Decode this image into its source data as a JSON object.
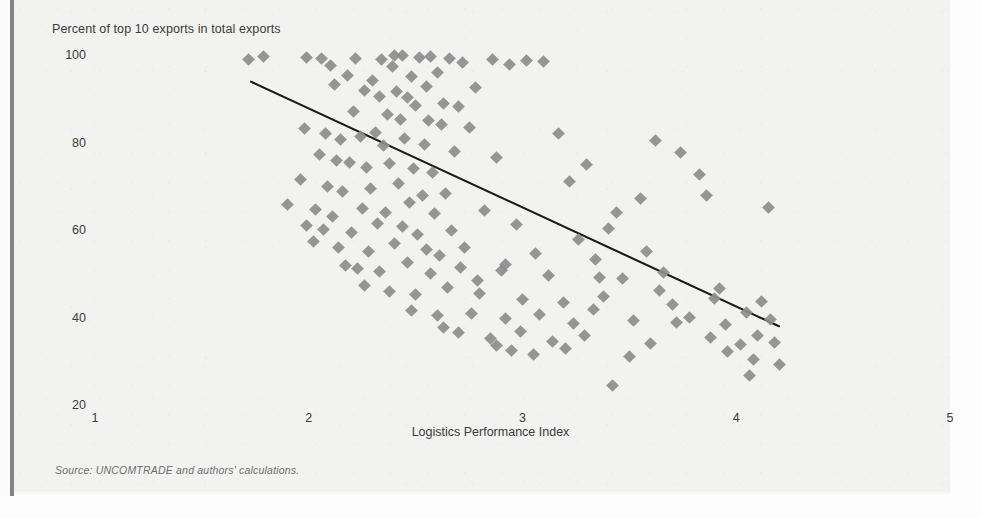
{
  "figure": {
    "source_note_label": "Source:",
    "source_note_text": " UNCOMTRADE and authors' calculations."
  },
  "chart_data": {
    "type": "scatter",
    "title": "",
    "ylabel": "Percent of top 10 exports in total exports",
    "xlabel": "Logistics Performance Index",
    "xlim": [
      1,
      5
    ],
    "ylim": [
      20,
      100
    ],
    "xticks": [
      1,
      2,
      3,
      4,
      5
    ],
    "yticks": [
      20,
      40,
      60,
      80,
      100
    ],
    "xtick_labels": [
      "1",
      "2",
      "3",
      "4",
      "5"
    ],
    "ytick_labels": [
      "20",
      "40",
      "60",
      "80",
      "100"
    ],
    "grid": false,
    "legend": null,
    "marker": "diamond",
    "marker_color": "#8d8d8d",
    "trendline": {
      "type": "linear",
      "color": "#1a1a1a",
      "x_start": 1.73,
      "y_start": 93.9,
      "x_end": 4.2,
      "y_end": 38.0
    },
    "points": [
      [
        1.72,
        99.0
      ],
      [
        1.79,
        99.6
      ],
      [
        1.99,
        99.5
      ],
      [
        2.06,
        99.1
      ],
      [
        2.1,
        97.6
      ],
      [
        2.18,
        95.4
      ],
      [
        2.22,
        99.3
      ],
      [
        2.3,
        94.2
      ],
      [
        2.34,
        99.0
      ],
      [
        2.39,
        97.3
      ],
      [
        2.4,
        99.9
      ],
      [
        2.44,
        99.8
      ],
      [
        2.48,
        95.0
      ],
      [
        2.52,
        99.4
      ],
      [
        2.57,
        99.7
      ],
      [
        2.6,
        96.1
      ],
      [
        2.66,
        99.2
      ],
      [
        2.72,
        98.4
      ],
      [
        2.78,
        92.6
      ],
      [
        2.86,
        99.0
      ],
      [
        2.94,
        97.9
      ],
      [
        3.02,
        98.7
      ],
      [
        3.1,
        98.6
      ],
      [
        2.12,
        93.3
      ],
      [
        2.26,
        92.0
      ],
      [
        2.33,
        90.5
      ],
      [
        2.41,
        91.7
      ],
      [
        2.46,
        90.3
      ],
      [
        2.5,
        88.5
      ],
      [
        2.55,
        92.8
      ],
      [
        2.63,
        89.0
      ],
      [
        2.7,
        88.2
      ],
      [
        2.21,
        87.0
      ],
      [
        2.37,
        86.4
      ],
      [
        2.43,
        85.3
      ],
      [
        2.56,
        85.0
      ],
      [
        2.62,
        84.2
      ],
      [
        2.75,
        83.5
      ],
      [
        1.98,
        83.3
      ],
      [
        2.08,
        82.0
      ],
      [
        2.15,
        80.6
      ],
      [
        2.24,
        81.3
      ],
      [
        2.31,
        82.2
      ],
      [
        2.35,
        79.4
      ],
      [
        2.45,
        80.9
      ],
      [
        2.54,
        79.6
      ],
      [
        2.68,
        78.0
      ],
      [
        3.17,
        82.1
      ],
      [
        3.62,
        80.4
      ],
      [
        3.74,
        77.8
      ],
      [
        2.05,
        77.2
      ],
      [
        2.13,
        76.0
      ],
      [
        2.19,
        75.4
      ],
      [
        2.27,
        74.3
      ],
      [
        2.38,
        75.1
      ],
      [
        2.49,
        74.0
      ],
      [
        2.58,
        73.2
      ],
      [
        2.88,
        76.5
      ],
      [
        3.3,
        74.9
      ],
      [
        3.83,
        72.6
      ],
      [
        1.96,
        71.5
      ],
      [
        2.09,
        70.0
      ],
      [
        2.16,
        68.8
      ],
      [
        2.29,
        69.5
      ],
      [
        2.42,
        70.6
      ],
      [
        2.53,
        67.9
      ],
      [
        2.64,
        68.4
      ],
      [
        3.22,
        71.0
      ],
      [
        3.55,
        67.1
      ],
      [
        3.86,
        68.0
      ],
      [
        1.9,
        65.8
      ],
      [
        2.03,
        64.7
      ],
      [
        2.11,
        63.2
      ],
      [
        2.25,
        65.0
      ],
      [
        2.36,
        64.1
      ],
      [
        2.47,
        66.2
      ],
      [
        2.59,
        63.8
      ],
      [
        2.82,
        64.4
      ],
      [
        3.44,
        63.9
      ],
      [
        4.15,
        65.1
      ],
      [
        1.99,
        61.0
      ],
      [
        2.07,
        60.2
      ],
      [
        2.2,
        59.5
      ],
      [
        2.32,
        61.6
      ],
      [
        2.44,
        60.8
      ],
      [
        2.51,
        58.9
      ],
      [
        2.67,
        59.8
      ],
      [
        2.97,
        61.2
      ],
      [
        3.26,
        57.8
      ],
      [
        3.4,
        60.3
      ],
      [
        2.02,
        57.4
      ],
      [
        2.14,
        56.1
      ],
      [
        2.28,
        55.0
      ],
      [
        2.4,
        57.0
      ],
      [
        2.55,
        55.6
      ],
      [
        2.61,
        54.2
      ],
      [
        2.73,
        56.0
      ],
      [
        3.06,
        54.6
      ],
      [
        3.34,
        53.3
      ],
      [
        3.58,
        55.1
      ],
      [
        2.17,
        52.0
      ],
      [
        2.23,
        51.2
      ],
      [
        2.33,
        50.5
      ],
      [
        2.46,
        52.6
      ],
      [
        2.57,
        50.0
      ],
      [
        2.71,
        51.4
      ],
      [
        2.9,
        50.8
      ],
      [
        3.12,
        49.6
      ],
      [
        3.47,
        48.9
      ],
      [
        3.66,
        50.2
      ],
      [
        2.26,
        47.3
      ],
      [
        2.38,
        46.0
      ],
      [
        2.5,
        45.2
      ],
      [
        2.65,
        46.8
      ],
      [
        2.8,
        45.6
      ],
      [
        3.0,
        44.1
      ],
      [
        3.19,
        43.5
      ],
      [
        3.38,
        44.8
      ],
      [
        3.7,
        43.0
      ],
      [
        3.9,
        44.3
      ],
      [
        2.48,
        41.6
      ],
      [
        2.6,
        40.4
      ],
      [
        2.76,
        41.0
      ],
      [
        2.92,
        39.8
      ],
      [
        3.08,
        40.7
      ],
      [
        3.24,
        38.6
      ],
      [
        3.52,
        39.4
      ],
      [
        3.78,
        40.0
      ],
      [
        3.95,
        38.3
      ],
      [
        4.05,
        41.2
      ],
      [
        2.7,
        36.5
      ],
      [
        2.85,
        35.2
      ],
      [
        2.99,
        36.8
      ],
      [
        3.14,
        34.6
      ],
      [
        3.29,
        35.9
      ],
      [
        3.6,
        34.0
      ],
      [
        3.88,
        35.4
      ],
      [
        4.02,
        33.8
      ],
      [
        4.1,
        36.0
      ],
      [
        4.18,
        34.4
      ],
      [
        2.95,
        32.4
      ],
      [
        3.05,
        31.6
      ],
      [
        3.2,
        33.0
      ],
      [
        3.5,
        31.0
      ],
      [
        3.96,
        32.2
      ],
      [
        4.08,
        30.5
      ],
      [
        4.2,
        29.3
      ],
      [
        3.42,
        24.5
      ],
      [
        4.06,
        26.8
      ],
      [
        2.88,
        33.6
      ],
      [
        2.63,
        37.8
      ],
      [
        3.33,
        41.8
      ],
      [
        3.64,
        46.2
      ],
      [
        4.12,
        43.6
      ],
      [
        2.79,
        48.4
      ],
      [
        2.92,
        52.2
      ],
      [
        3.36,
        49.2
      ],
      [
        3.72,
        38.9
      ],
      [
        3.92,
        46.6
      ],
      [
        4.16,
        39.6
      ]
    ]
  }
}
